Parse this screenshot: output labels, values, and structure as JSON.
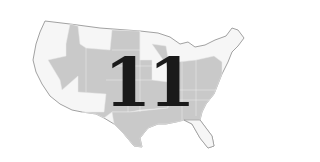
{
  "map": {
    "region": "Contiguous United States",
    "highlight_color": "#c8c8c8",
    "base_color": "#f4f4f4",
    "border_color": "#8a8a8a",
    "highlighted_region_note": "Interior/Mountain West, Plains, Midwest, South and mid-Atlantic states shaded gray"
  },
  "overlay": {
    "number": "11",
    "color": "#1a1a1a"
  }
}
